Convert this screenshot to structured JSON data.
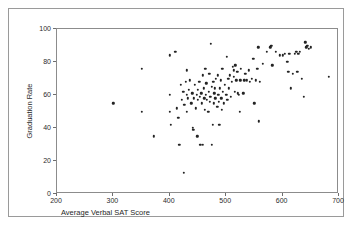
{
  "figure": {
    "top_sliver_text": "",
    "background_color": "#ffffff",
    "frame_color": "#9a9a9a",
    "point_color": "#232323"
  },
  "chart_data": {
    "type": "scatter",
    "title": "",
    "xlabel": "Average Verbal SAT Score",
    "ylabel": "Graduation Rate",
    "xlim": [
      200,
      700
    ],
    "ylim": [
      0,
      100
    ],
    "xticks": [
      200,
      300,
      400,
      500,
      600,
      700
    ],
    "yticks": [
      0,
      20,
      40,
      60,
      80,
      100
    ],
    "grid": false,
    "legend": null,
    "marker": "filled-circle",
    "points": [
      [
        300,
        55
      ],
      [
        350,
        76
      ],
      [
        350,
        50
      ],
      [
        372,
        35
      ],
      [
        400,
        84
      ],
      [
        400,
        60
      ],
      [
        400,
        50
      ],
      [
        402,
        42
      ],
      [
        410,
        86
      ],
      [
        412,
        52
      ],
      [
        415,
        46
      ],
      [
        417,
        30
      ],
      [
        420,
        66
      ],
      [
        421,
        57
      ],
      [
        424,
        62
      ],
      [
        425,
        13
      ],
      [
        426,
        54
      ],
      [
        428,
        68
      ],
      [
        430,
        75
      ],
      [
        430,
        60
      ],
      [
        430,
        50
      ],
      [
        432,
        58
      ],
      [
        434,
        63
      ],
      [
        436,
        69
      ],
      [
        438,
        55
      ],
      [
        440,
        61
      ],
      [
        441,
        40
      ],
      [
        442,
        39
      ],
      [
        443,
        58
      ],
      [
        444,
        66
      ],
      [
        446,
        52
      ],
      [
        448,
        60
      ],
      [
        449,
        35
      ],
      [
        450,
        57
      ],
      [
        450,
        63
      ],
      [
        452,
        68
      ],
      [
        453,
        59
      ],
      [
        454,
        30
      ],
      [
        456,
        61
      ],
      [
        457,
        55
      ],
      [
        458,
        30
      ],
      [
        459,
        72
      ],
      [
        460,
        64
      ],
      [
        461,
        58
      ],
      [
        462,
        51
      ],
      [
        463,
        76
      ],
      [
        464,
        60
      ],
      [
        465,
        67
      ],
      [
        466,
        57
      ],
      [
        468,
        50
      ],
      [
        469,
        62
      ],
      [
        470,
        73
      ],
      [
        471,
        56
      ],
      [
        472,
        59
      ],
      [
        473,
        91
      ],
      [
        474,
        65
      ],
      [
        475,
        30
      ],
      [
        476,
        42
      ],
      [
        477,
        68
      ],
      [
        478,
        55
      ],
      [
        479,
        61
      ],
      [
        480,
        64
      ],
      [
        481,
        58
      ],
      [
        482,
        70
      ],
      [
        484,
        53
      ],
      [
        485,
        72
      ],
      [
        486,
        60
      ],
      [
        487,
        56
      ],
      [
        488,
        42
      ],
      [
        489,
        64
      ],
      [
        490,
        69
      ],
      [
        491,
        58
      ],
      [
        492,
        51
      ],
      [
        493,
        76
      ],
      [
        494,
        62
      ],
      [
        496,
        55
      ],
      [
        498,
        66
      ],
      [
        500,
        60
      ],
      [
        501,
        83
      ],
      [
        502,
        57
      ],
      [
        504,
        70
      ],
      [
        505,
        64
      ],
      [
        506,
        72
      ],
      [
        508,
        59
      ],
      [
        510,
        68
      ],
      [
        512,
        77
      ],
      [
        513,
        75
      ],
      [
        514,
        71
      ],
      [
        515,
        62
      ],
      [
        516,
        78
      ],
      [
        518,
        69
      ],
      [
        520,
        74
      ],
      [
        521,
        61
      ],
      [
        522,
        60
      ],
      [
        524,
        50
      ],
      [
        525,
        69
      ],
      [
        526,
        76
      ],
      [
        530,
        61
      ],
      [
        532,
        69
      ],
      [
        534,
        73
      ],
      [
        537,
        69
      ],
      [
        540,
        75
      ],
      [
        542,
        68
      ],
      [
        545,
        70
      ],
      [
        548,
        82
      ],
      [
        550,
        55
      ],
      [
        552,
        69
      ],
      [
        555,
        76
      ],
      [
        557,
        89
      ],
      [
        558,
        44
      ],
      [
        560,
        68
      ],
      [
        565,
        79
      ],
      [
        572,
        86
      ],
      [
        578,
        89
      ],
      [
        580,
        90
      ],
      [
        582,
        78
      ],
      [
        588,
        86
      ],
      [
        595,
        84
      ],
      [
        600,
        84
      ],
      [
        604,
        85
      ],
      [
        608,
        80
      ],
      [
        610,
        74
      ],
      [
        612,
        85
      ],
      [
        614,
        64
      ],
      [
        618,
        73
      ],
      [
        622,
        85
      ],
      [
        624,
        86
      ],
      [
        626,
        74
      ],
      [
        628,
        85
      ],
      [
        630,
        86
      ],
      [
        634,
        70
      ],
      [
        638,
        59
      ],
      [
        640,
        92
      ],
      [
        642,
        89
      ],
      [
        644,
        90
      ],
      [
        646,
        88
      ],
      [
        650,
        89
      ],
      [
        682,
        71
      ]
    ]
  }
}
